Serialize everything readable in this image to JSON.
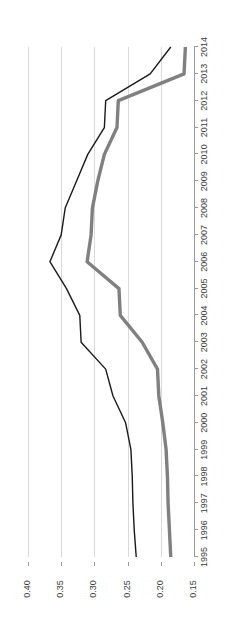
{
  "chart_data": {
    "type": "line",
    "title": "",
    "subtitle": "",
    "xlabel": "",
    "ylabel": "",
    "orientation": "rotated-90-ccw",
    "grid": true,
    "legend": "none",
    "categories": [
      "1995",
      "1996",
      "1997",
      "1998",
      "1999",
      "2000",
      "2001",
      "2002",
      "2003",
      "2004",
      "2005",
      "2006",
      "2007",
      "2008",
      "2009",
      "2010",
      "2011",
      "2012",
      "2013",
      "2014"
    ],
    "value_ticks": [
      "0.40",
      "0.35",
      "0.30",
      "0.25",
      "0.20",
      "0.15"
    ],
    "value_tick_numbers": [
      0.4,
      0.35,
      0.3,
      0.25,
      0.2,
      0.15
    ],
    "ylim": [
      0.15,
      0.4
    ],
    "series": [
      {
        "name": "series-black",
        "color": "#1a1a1a",
        "width": 1.4,
        "values": [
          0.237,
          0.24,
          0.242,
          0.243,
          0.245,
          0.253,
          0.272,
          0.283,
          0.32,
          0.322,
          0.342,
          0.367,
          0.35,
          0.344,
          0.327,
          0.31,
          0.285,
          0.283,
          0.216,
          0.185
        ]
      },
      {
        "name": "series-gray",
        "color": "#808080",
        "width": 3.4,
        "values": [
          0.185,
          0.187,
          0.189,
          0.19,
          0.192,
          0.197,
          0.203,
          0.205,
          0.228,
          0.261,
          0.263,
          0.311,
          0.305,
          0.303,
          0.295,
          0.285,
          0.266,
          0.264,
          0.165,
          0.163
        ]
      }
    ]
  }
}
